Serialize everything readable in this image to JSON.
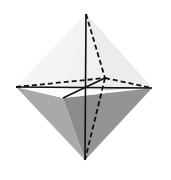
{
  "figure": {
    "vertices": {
      "top": [
        86,
        14
      ],
      "bottom": [
        85,
        160
      ],
      "left": [
        16,
        87
      ],
      "right": [
        152,
        88
      ],
      "back": [
        105,
        78
      ],
      "front": [
        63,
        98
      ]
    },
    "colors": {
      "background": "#ffffff",
      "upper_back_face": "#e6e6e6",
      "upper_left_face": "#f4f4f4",
      "upper_front_face": "#fafafa",
      "lower_left_face": "#a8a8a8",
      "lower_front_face": "#8e8e8e",
      "lower_right_face": "#9a9a9a",
      "edge": "#111111"
    }
  }
}
